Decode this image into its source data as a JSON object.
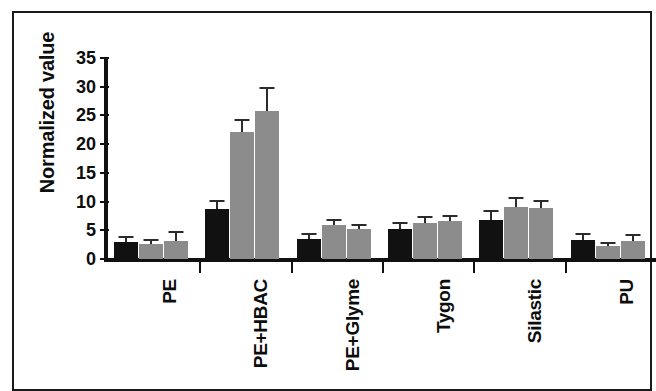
{
  "chart_data": {
    "type": "bar",
    "title": "",
    "subtitle": "",
    "xlabel": "",
    "ylabel": "Normalized value",
    "ylim": [
      0,
      35
    ],
    "yticks": [
      0,
      5,
      10,
      15,
      20,
      25,
      30,
      35
    ],
    "ytick_labels": [
      "0",
      "5",
      "10",
      "15",
      "20",
      "25",
      "30",
      "35"
    ],
    "grid": false,
    "legend": "none",
    "categories": [
      "PE",
      "PE+HBAC",
      "PE+Glyme",
      "Tygon",
      "Silastic",
      "PU"
    ],
    "series": [
      {
        "name": "Series 1",
        "color": "#111111",
        "values": [
          2.9,
          8.7,
          3.5,
          5.2,
          6.8,
          3.3
        ],
        "errors": [
          0.8,
          1.3,
          0.7,
          0.9,
          1.4,
          0.8
        ]
      },
      {
        "name": "Series 2",
        "color": "#8c8c8c",
        "values": [
          2.6,
          22.1,
          6.0,
          6.2,
          9.0,
          2.2
        ],
        "errors": [
          0.6,
          2.0,
          0.6,
          0.9,
          1.5,
          0.4
        ]
      },
      {
        "name": "Series 3",
        "color": "#8c8c8c",
        "values": [
          3.1,
          25.8,
          5.2,
          6.6,
          8.9,
          3.1
        ],
        "errors": [
          1.4,
          3.8,
          0.6,
          0.7,
          1.0,
          0.9
        ]
      }
    ]
  },
  "axes": {
    "ylabel": "Normalized value",
    "tick_0": "0",
    "tick_5": "5",
    "tick_10": "10",
    "tick_15": "15",
    "tick_20": "20",
    "tick_25": "25",
    "tick_30": "30",
    "tick_35": "35",
    "cat_0": "PE",
    "cat_1": "PE+HBAC",
    "cat_2": "PE+Glyme",
    "cat_3": "Tygon",
    "cat_4": "Silastic",
    "cat_5": "PU"
  }
}
